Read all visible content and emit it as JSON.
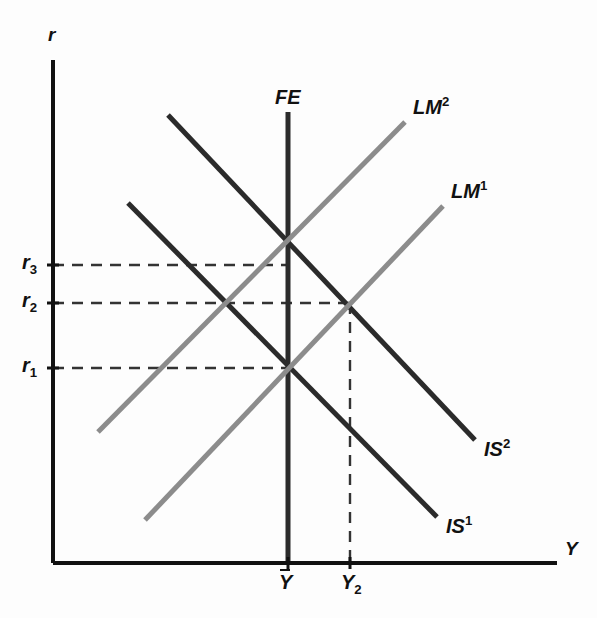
{
  "chart_data": {
    "type": "line",
    "xlabel": "Y",
    "ylabel": "r",
    "grid": false,
    "legend": "inline-curve-labels",
    "axes": {
      "origin": [
        53,
        563
      ],
      "x_axis_end": [
        557,
        563
      ],
      "y_axis_top": [
        53,
        60
      ],
      "xlim_px": [
        53,
        557
      ],
      "ylim_px": [
        563,
        60
      ]
    },
    "x_ticks": [
      {
        "label": "Ȳ",
        "text": "Y",
        "overbar": true,
        "x_px": 288
      },
      {
        "label": "Y2",
        "text": "Y",
        "sub": "2",
        "x_px": 350
      }
    ],
    "y_ticks": [
      {
        "label": "r3",
        "text": "r",
        "sub": "3",
        "y_px": 265
      },
      {
        "label": "r2",
        "text": "r",
        "sub": "2",
        "y_px": 303
      },
      {
        "label": "r1",
        "text": "r",
        "sub": "1",
        "y_px": 368
      }
    ],
    "series": [
      {
        "name": "FE",
        "label": "FE",
        "kind": "vertical-line",
        "color": "#2b2b2b",
        "width": 5,
        "points": [
          [
            288,
            112
          ],
          [
            288,
            563
          ]
        ],
        "label_pos": [
          275,
          86
        ]
      },
      {
        "name": "IS2",
        "label": "IS",
        "superscript": "2",
        "kind": "downward-sloping",
        "color": "#2b2b2b",
        "width": 5,
        "points": [
          [
            168,
            115
          ],
          [
            475,
            440
          ]
        ],
        "label_pos": [
          484,
          436
        ]
      },
      {
        "name": "IS1",
        "label": "IS",
        "superscript": "1",
        "kind": "downward-sloping",
        "color": "#2b2b2b",
        "width": 5,
        "points": [
          [
            128,
            203
          ],
          [
            437,
            517
          ]
        ],
        "label_pos": [
          446,
          513
        ]
      },
      {
        "name": "LM2",
        "label": "LM",
        "superscript": "2",
        "kind": "upward-sloping",
        "color": "#8c8c8c",
        "width": 5,
        "points": [
          [
            98,
            432
          ],
          [
            405,
            122
          ]
        ],
        "label_pos": [
          413,
          94
        ]
      },
      {
        "name": "LM1",
        "label": "LM",
        "superscript": "1",
        "kind": "upward-sloping",
        "color": "#8c8c8c",
        "width": 5,
        "points": [
          [
            145,
            520
          ],
          [
            443,
            206
          ]
        ],
        "label_pos": [
          451,
          178
        ]
      }
    ],
    "equilibria": [
      {
        "name": "E3",
        "x_px": 288,
        "y_px": 265,
        "r": "r3",
        "y": "Ybar",
        "curves": [
          "IS2",
          "LM2",
          "FE"
        ]
      },
      {
        "name": "E2",
        "x_px": 350,
        "y_px": 303,
        "r": "r2",
        "y": "Y2",
        "curves": [
          "IS2",
          "LM1"
        ]
      },
      {
        "name": "E2b",
        "x_px": 230,
        "y_px": 303,
        "r": "r2",
        "curves": [
          "IS1",
          "LM2"
        ]
      },
      {
        "name": "E1",
        "x_px": 288,
        "y_px": 368,
        "r": "r1",
        "y": "Ybar",
        "curves": [
          "IS1",
          "LM1",
          "FE"
        ]
      }
    ],
    "guides": [
      {
        "name": "r3-guide",
        "orientation": "horizontal",
        "from": [
          53,
          265
        ],
        "to": [
          288,
          265
        ],
        "style": "dashed"
      },
      {
        "name": "r2-guide",
        "orientation": "horizontal",
        "from": [
          53,
          303
        ],
        "to": [
          350,
          303
        ],
        "style": "dashed"
      },
      {
        "name": "r1-guide",
        "orientation": "horizontal",
        "from": [
          53,
          368
        ],
        "to": [
          288,
          368
        ],
        "style": "dashed"
      },
      {
        "name": "Y2-guide",
        "orientation": "vertical",
        "from": [
          350,
          303
        ],
        "to": [
          350,
          563
        ],
        "style": "dashed"
      }
    ],
    "colors": {
      "axis": "#111111",
      "is_curve": "#2b2b2b",
      "lm_curve": "#8c8c8c",
      "guide": "#333333",
      "background": "#fdfdfd"
    }
  },
  "labels": {
    "y_axis": "r",
    "x_axis": "Y",
    "fe": "FE",
    "is_base": "IS",
    "lm_base": "LM",
    "sup_1": "1",
    "sup_2": "2",
    "r_base": "r",
    "sub_1": "1",
    "sub_2": "2",
    "sub_3": "3",
    "y_base": "Y"
  }
}
